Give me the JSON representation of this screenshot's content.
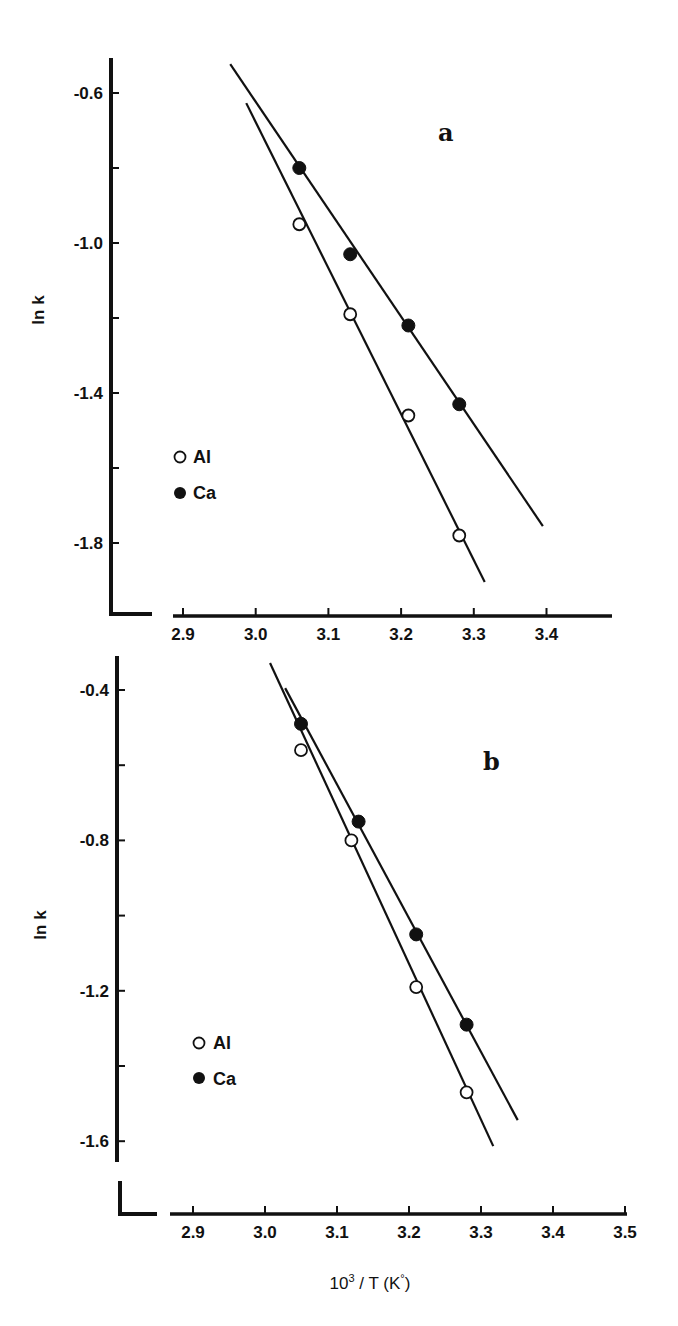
{
  "chart_data": [
    {
      "type": "scatter",
      "panel": "a",
      "panel_label": "a",
      "title": "",
      "xlabel": "",
      "ylabel": "ln k",
      "xlim": [
        2.84,
        3.5
      ],
      "ylim": [
        -2.0,
        -0.47
      ],
      "x_ticks": [
        2.9,
        3.0,
        3.1,
        3.2,
        3.3,
        3.4
      ],
      "x_tick_labels": [
        "2.9",
        "3.0",
        "3.1",
        "3.2",
        "3.3",
        "3.4"
      ],
      "y_ticks": [
        -0.6,
        -0.8,
        -1.0,
        -1.2,
        -1.4,
        -1.6,
        -1.8
      ],
      "y_tick_labels": [
        "-0.6",
        "",
        "-1.0",
        "",
        "-1.4",
        "",
        "-1.8"
      ],
      "grid": false,
      "legend_position": "left-middle",
      "series": [
        {
          "name": "Al",
          "marker": "open-circle",
          "x": [
            3.06,
            3.13,
            3.21,
            3.28
          ],
          "y": [
            -0.95,
            -1.19,
            -1.46,
            -1.78
          ],
          "fit_line": {
            "x": [
              2.987,
              3.315
            ],
            "y": [
              -0.627,
              -1.904
            ]
          }
        },
        {
          "name": "Ca",
          "marker": "filled-circle",
          "x": [
            3.06,
            3.13,
            3.21,
            3.28
          ],
          "y": [
            -0.8,
            -1.03,
            -1.22,
            -1.43
          ],
          "fit_line": {
            "x": [
              2.965,
              3.395
            ],
            "y": [
              -0.523,
              -1.755
            ]
          }
        }
      ]
    },
    {
      "type": "scatter",
      "panel": "b",
      "panel_label": "b",
      "title": "",
      "xlabel": "10³ / T (K°)",
      "ylabel": "ln k",
      "xlim": [
        2.84,
        3.5
      ],
      "ylim": [
        -1.7,
        -0.31
      ],
      "x_ticks": [
        2.9,
        3.0,
        3.1,
        3.2,
        3.3,
        3.4,
        3.5
      ],
      "x_tick_labels": [
        "2.9",
        "3.0",
        "3.1",
        "3.2",
        "3.3",
        "3.4",
        "3.5"
      ],
      "y_ticks": [
        -0.4,
        -0.6,
        -0.8,
        -1.0,
        -1.2,
        -1.4,
        -1.6
      ],
      "y_tick_labels": [
        "-0.4",
        "",
        "-0.8",
        "",
        "-1.2",
        "",
        "-1.6"
      ],
      "grid": false,
      "legend_position": "left-lower",
      "series": [
        {
          "name": "Al",
          "marker": "open-circle",
          "x": [
            3.05,
            3.12,
            3.21,
            3.28
          ],
          "y": [
            -0.56,
            -0.8,
            -1.19,
            -1.47
          ],
          "fit_line": {
            "x": [
              3.007,
              3.317
            ],
            "y": [
              -0.328,
              -1.613
            ]
          }
        },
        {
          "name": "Ca",
          "marker": "filled-circle",
          "x": [
            3.05,
            3.13,
            3.21,
            3.28
          ],
          "y": [
            -0.49,
            -0.75,
            -1.05,
            -1.29
          ],
          "fit_line": {
            "x": [
              3.028,
              3.351
            ],
            "y": [
              -0.395,
              -1.544
            ]
          }
        }
      ]
    }
  ],
  "panels": {
    "a": {
      "label": "a",
      "ylabel": "ln k",
      "legend": [
        {
          "marker": "○",
          "label": "Al"
        },
        {
          "marker": "●",
          "label": "Ca"
        }
      ]
    },
    "b": {
      "label": "b",
      "ylabel": "ln k",
      "xlabel_base": "10",
      "xlabel_sup": "3",
      "xlabel_rest": " / T (K",
      "xlabel_deg": "°",
      "xlabel_close": ")",
      "legend": [
        {
          "marker": "○",
          "label": "Al"
        },
        {
          "marker": "●",
          "label": "Ca"
        }
      ]
    }
  },
  "colors": {
    "ink": "#111111",
    "background": "#ffffff"
  }
}
